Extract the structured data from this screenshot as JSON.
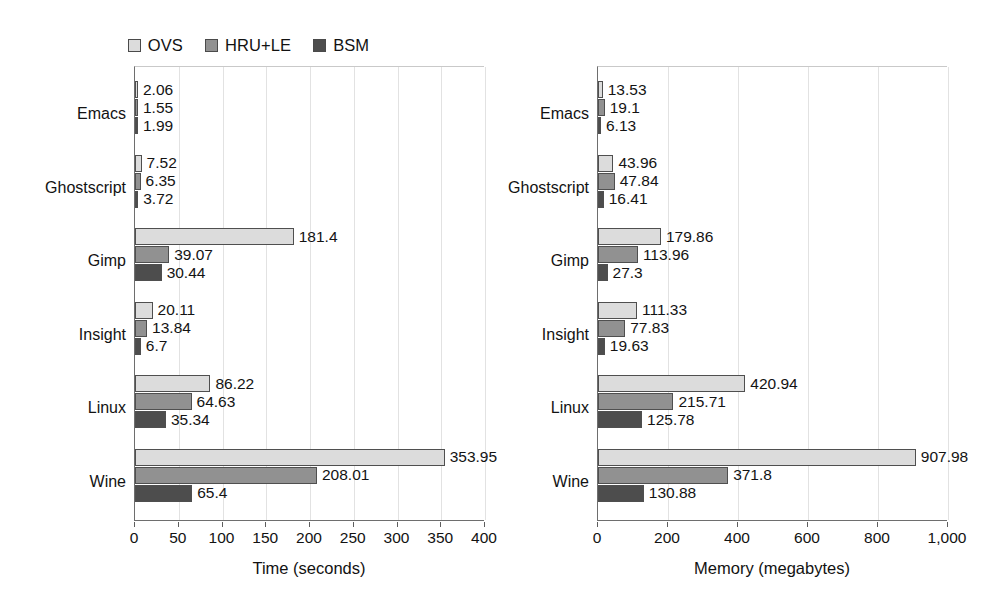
{
  "legend": {
    "items": [
      {
        "label": "OVS",
        "color": "#dcdcdc"
      },
      {
        "label": "HRU+LE",
        "color": "#919191"
      },
      {
        "label": "BSM",
        "color": "#4d4d4d"
      }
    ]
  },
  "chart_data": [
    {
      "type": "bar",
      "orientation": "horizontal",
      "title": "",
      "xlabel": "Time (seconds)",
      "ylabel": "",
      "xlim": [
        0,
        400
      ],
      "xticks": [
        0,
        50,
        100,
        150,
        200,
        250,
        300,
        350,
        400
      ],
      "xticklabels": [
        "0",
        "50",
        "100",
        "150",
        "200",
        "250",
        "300",
        "350",
        "400"
      ],
      "grid": true,
      "legend_position": "top-center",
      "categories": [
        "Emacs",
        "Ghostscript",
        "Gimp",
        "Insight",
        "Linux",
        "Wine"
      ],
      "series": [
        {
          "name": "OVS",
          "color": "#dcdcdc",
          "values": [
            2.06,
            7.52,
            181.4,
            20.11,
            86.22,
            353.95
          ],
          "labels": [
            "2.06",
            "7.52",
            "181.4",
            "20.11",
            "86.22",
            "353.95"
          ]
        },
        {
          "name": "HRU+LE",
          "color": "#919191",
          "values": [
            1.55,
            6.35,
            39.07,
            13.84,
            64.63,
            208.01
          ],
          "labels": [
            "1.55",
            "6.35",
            "39.07",
            "13.84",
            "64.63",
            "208.01"
          ]
        },
        {
          "name": "BSM",
          "color": "#4d4d4d",
          "values": [
            1.99,
            3.72,
            30.44,
            6.7,
            35.34,
            65.4
          ],
          "labels": [
            "1.99",
            "3.72",
            "30.44",
            "6.7",
            "35.34",
            "65.4"
          ]
        }
      ]
    },
    {
      "type": "bar",
      "orientation": "horizontal",
      "title": "",
      "xlabel": "Memory (megabytes)",
      "ylabel": "",
      "xlim": [
        0,
        1000
      ],
      "xticks": [
        0,
        200,
        400,
        600,
        800,
        1000
      ],
      "xticklabels": [
        "0",
        "200",
        "400",
        "600",
        "800",
        "1,000"
      ],
      "grid": true,
      "legend_position": "top-center",
      "categories": [
        "Emacs",
        "Ghostscript",
        "Gimp",
        "Insight",
        "Linux",
        "Wine"
      ],
      "series": [
        {
          "name": "OVS",
          "color": "#dcdcdc",
          "values": [
            13.53,
            43.96,
            179.86,
            111.33,
            420.94,
            907.98
          ],
          "labels": [
            "13.53",
            "43.96",
            "179.86",
            "111.33",
            "420.94",
            "907.98"
          ]
        },
        {
          "name": "HRU+LE",
          "color": "#919191",
          "values": [
            19.1,
            47.84,
            113.96,
            77.83,
            215.71,
            371.8
          ],
          "labels": [
            "19.1",
            "47.84",
            "113.96",
            "77.83",
            "215.71",
            "371.8"
          ]
        },
        {
          "name": "BSM",
          "color": "#4d4d4d",
          "values": [
            6.13,
            16.41,
            27.3,
            19.63,
            125.78,
            130.88
          ],
          "labels": [
            "6.13",
            "16.41",
            "27.3",
            "19.63",
            "125.78",
            "130.88"
          ]
        }
      ]
    }
  ]
}
